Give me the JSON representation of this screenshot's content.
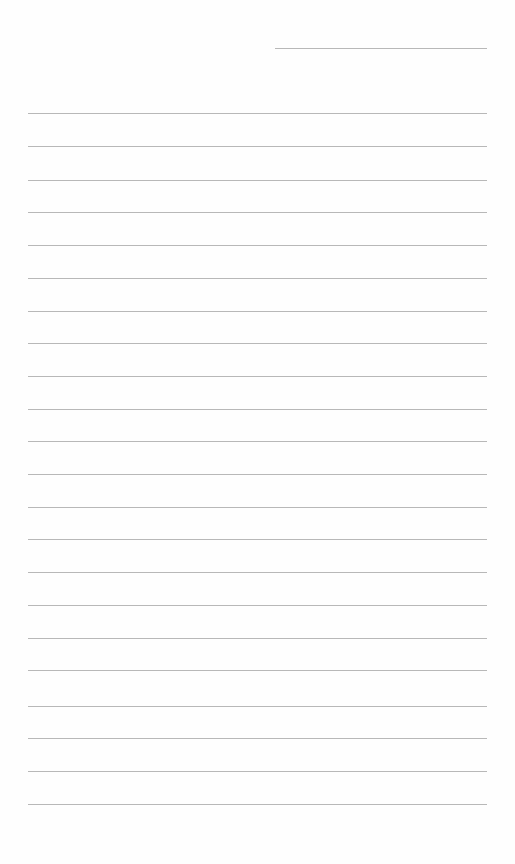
{
  "page": {
    "type": "lined-paper",
    "background": "#fefefe",
    "line_color": "#b8b8b8",
    "header_line": {
      "x1": 275,
      "x2": 487,
      "y": 48
    },
    "rule_lines": {
      "x1": 28,
      "x2": 487,
      "y_positions": [
        113,
        146,
        180,
        212,
        245,
        278,
        311,
        343,
        376,
        409,
        441,
        474,
        507,
        539,
        572,
        605,
        638,
        670,
        706,
        738,
        771,
        804
      ]
    }
  }
}
